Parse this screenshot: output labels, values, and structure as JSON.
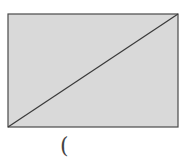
{
  "diagram": {
    "shape": "rectangle-with-diagonal",
    "rectangle": {
      "x": 8,
      "y": 14,
      "width": 170,
      "height": 113,
      "fill": "#d9d9d9",
      "stroke": "#4a4a4a"
    },
    "diagonal": {
      "x1": 8,
      "y1": 127,
      "x2": 178,
      "y2": 14,
      "stroke": "#3a3a3a"
    },
    "label": "("
  }
}
